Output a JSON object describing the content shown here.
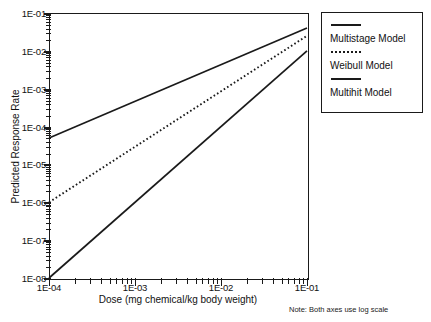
{
  "chart_data": {
    "type": "line",
    "title": "",
    "xlabel": "Dose (mg chemical/kg body weight)",
    "ylabel": "Predicted Response Rate",
    "xscale": "log",
    "yscale": "log",
    "xlim": [
      0.0001,
      0.1
    ],
    "ylim": [
      1e-08,
      0.1
    ],
    "xticklabels": [
      "1E-04",
      "1E-03",
      "1E-02",
      "1E-01"
    ],
    "xtickvalues": [
      0.0001,
      0.001,
      0.01,
      0.1
    ],
    "yticklabels": [
      "1E-01",
      "1E-02",
      "1E-03",
      "1E-04",
      "1E-05",
      "1E-06",
      "1E-07",
      "1E-08"
    ],
    "ytickvalues": [
      0.1,
      0.01,
      0.001,
      0.0001,
      1e-05,
      1e-06,
      1e-07,
      1e-08
    ],
    "grid": false,
    "legend_position": "right-outside",
    "annotation": "Note: Both axes use log scale",
    "series": [
      {
        "name": "Multistage Model",
        "style": "solid",
        "color": "#1a1a1a",
        "x": [
          0.0001,
          0.1
        ],
        "y": [
          5e-05,
          0.04
        ]
      },
      {
        "name": "Weibull Model",
        "style": "dotted",
        "color": "#1a1a1a",
        "x": [
          0.0001,
          0.1
        ],
        "y": [
          1e-06,
          0.025
        ]
      },
      {
        "name": "Multihit Model",
        "style": "solid",
        "color": "#1a1a1a",
        "x": [
          0.0001,
          0.1
        ],
        "y": [
          1e-08,
          0.01
        ]
      }
    ]
  },
  "axes": {
    "x_title": "Dose (mg chemical/kg body weight)",
    "y_title": "Predicted Response Rate",
    "x_labels": [
      "1E-04",
      "1E-03",
      "1E-02",
      "1E-01"
    ],
    "y_labels": [
      "1E-01",
      "1E-02",
      "1E-03",
      "1E-04",
      "1E-05",
      "1E-06",
      "1E-07",
      "1E-08"
    ]
  },
  "legend": {
    "entries": [
      {
        "label": "Multistage Model",
        "style": "solid"
      },
      {
        "label": "Weibull Model",
        "style": "dotted"
      },
      {
        "label": "Multihit Model",
        "style": "solid"
      }
    ]
  },
  "note": {
    "text": "Note: Both axes use log scale"
  },
  "colors": {
    "line": "#1a1a1a",
    "axis": "#1a1a1a",
    "background": "#ffffff",
    "text": "#111111"
  }
}
